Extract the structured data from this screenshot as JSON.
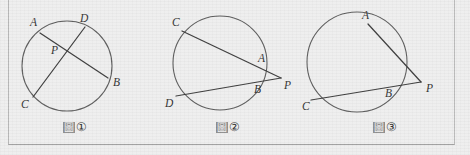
{
  "document": {
    "title": "Circle power-of-a-point diagrams",
    "background_color": "#eeeeee",
    "line_color": "#3a3a3a",
    "circle_color": "#5a5a5a"
  },
  "figures": [
    {
      "id": "fig1",
      "caption_word": "圖",
      "caption_number": "①",
      "description": "Two chords AB and CD intersecting at interior point P",
      "point_labels": {
        "A": "A",
        "B": "B",
        "C": "C",
        "D": "D",
        "P": "P"
      }
    },
    {
      "id": "fig2",
      "caption_word": "圖",
      "caption_number": "②",
      "description": "Two secants from external point P meeting circle at A,C and B,D",
      "point_labels": {
        "A": "A",
        "B": "B",
        "C": "C",
        "D": "D",
        "P": "P"
      }
    },
    {
      "id": "fig3",
      "caption_word": "圖",
      "caption_number": "③",
      "description": "Tangent PA and secant through B and C from external point P",
      "point_labels": {
        "A": "A",
        "B": "B",
        "C": "C",
        "P": "P"
      }
    }
  ]
}
